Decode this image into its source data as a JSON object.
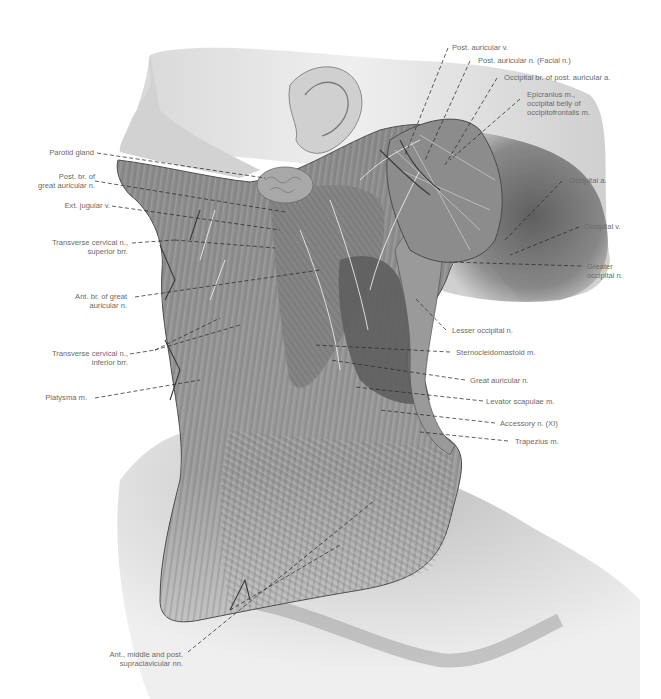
{
  "figure": {
    "labels_left": [
      {
        "id": "parotid-gland",
        "lines": [
          "Parotid gland"
        ]
      },
      {
        "id": "post-br-great-auricular",
        "lines": [
          "Post. br. of",
          "great auricular n."
        ]
      },
      {
        "id": "ext-jugular-v",
        "lines": [
          "Ext. jugular v."
        ]
      },
      {
        "id": "transverse-cervical-superior",
        "lines": [
          "Transverse cervical n.,",
          "superior brr."
        ]
      },
      {
        "id": "ant-br-great-auricular",
        "lines": [
          "Ant. br. of great",
          "auricular n."
        ]
      },
      {
        "id": "transverse-cervical-inferior",
        "lines": [
          "Transverse cervical n.,",
          "inferior brr."
        ]
      },
      {
        "id": "platysma",
        "lines": [
          "Platysma m."
        ]
      }
    ],
    "labels_top_right": [
      {
        "id": "post-auricular-v",
        "lines": [
          "Post. auricular v."
        ]
      },
      {
        "id": "post-auricular-n",
        "lines": [
          "Post. auricular n. (Facial n.)"
        ]
      },
      {
        "id": "occipital-br-post-auricular-a",
        "lines": [
          "Occipital br. of post. auricular a."
        ]
      },
      {
        "id": "epicranius",
        "lines": [
          "Epicranius m.,",
          "occipital belly of",
          "occipitofrontalis m."
        ]
      }
    ],
    "labels_right": [
      {
        "id": "occipital-a",
        "lines": [
          "Occipital a."
        ]
      },
      {
        "id": "occipital-v",
        "lines": [
          "Occipital v."
        ]
      },
      {
        "id": "greater-occipital-n",
        "lines": [
          "Greater",
          "occipital n."
        ]
      },
      {
        "id": "lesser-occipital-n",
        "lines": [
          "Lesser occipital n."
        ]
      },
      {
        "id": "sternocleidomastoid",
        "lines": [
          "Sternocleidomastoid m."
        ]
      },
      {
        "id": "great-auricular-n",
        "lines": [
          "Great auricular n."
        ]
      },
      {
        "id": "levator-scapulae",
        "lines": [
          "Levator scapulae m."
        ]
      },
      {
        "id": "accessory-n",
        "lines": [
          "Accessory n. (XI)"
        ]
      },
      {
        "id": "trapezius",
        "lines": [
          "Trapezius m."
        ]
      }
    ],
    "labels_bottom": [
      {
        "id": "supraclavicular-nn",
        "lines": [
          "Ant., middle and post.",
          "supraclavicular nn."
        ]
      }
    ],
    "colors": {
      "label_text": "#6a6a6a",
      "leader_line": "#2a2a2a",
      "skin_light": "#e6e6e6",
      "skin_shadow": "#9a9a9a",
      "muscle": "#8e8e8e",
      "muscle_dark": "#5a5a5a",
      "background": "#ffffff"
    }
  }
}
